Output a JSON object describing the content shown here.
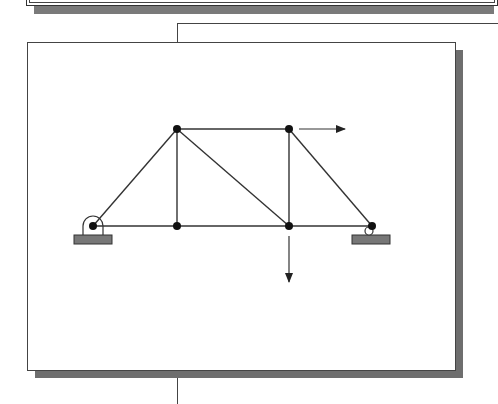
{
  "diagram": {
    "type": "truss",
    "colors": {
      "member": "#333333",
      "joint": "#111111",
      "support_base": "#777777",
      "frame_shadow": "#6e6e6e"
    },
    "joints": [
      {
        "id": "A",
        "x": 93,
        "y": 226,
        "support": "pin"
      },
      {
        "id": "B",
        "x": 177,
        "y": 129
      },
      {
        "id": "C",
        "x": 177,
        "y": 226
      },
      {
        "id": "D",
        "x": 289,
        "y": 129
      },
      {
        "id": "E",
        "x": 289,
        "y": 226
      },
      {
        "id": "F",
        "x": 372,
        "y": 226,
        "support": "roller"
      }
    ],
    "members": [
      [
        "A",
        "B"
      ],
      [
        "A",
        "C"
      ],
      [
        "B",
        "C"
      ],
      [
        "B",
        "D"
      ],
      [
        "B",
        "E"
      ],
      [
        "C",
        "E"
      ],
      [
        "D",
        "E"
      ],
      [
        "D",
        "F"
      ],
      [
        "E",
        "F"
      ]
    ],
    "loads": [
      {
        "at": "D",
        "direction": "right"
      },
      {
        "at": "E",
        "direction": "down"
      }
    ]
  }
}
